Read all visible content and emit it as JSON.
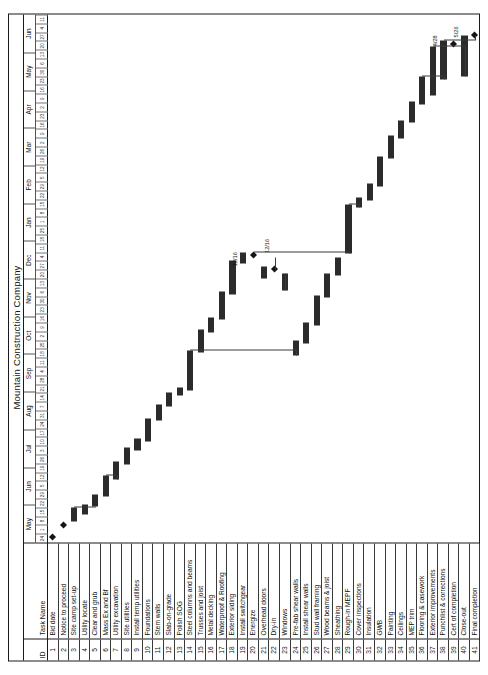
{
  "document": {
    "title": "Mountain Construction Company",
    "orientation": "landscape-rotated"
  },
  "columns": {
    "id_header": "ID",
    "name_header": "Task Name"
  },
  "timeline": {
    "months": [
      "May",
      "Jun",
      "Jul",
      "Aug",
      "Sep",
      "Oct",
      "Nov",
      "Dec",
      "Jan",
      "Feb",
      "Mar",
      "Apr",
      "May",
      "Jun"
    ],
    "week_tick_sample": [
      "24",
      "1",
      "8",
      "15",
      "22",
      "29",
      "5",
      "12",
      "19",
      "26",
      "3",
      "10",
      "17",
      "24",
      "31",
      "7",
      "14",
      "21",
      "28",
      "4",
      "11",
      "18",
      "25",
      "2",
      "9",
      "16",
      "23",
      "30",
      "6",
      "13",
      "20",
      "27",
      "4",
      "11",
      "18",
      "25",
      "1",
      "8",
      "15",
      "22",
      "29",
      "5",
      "12",
      "19",
      "26",
      "2",
      "9",
      "16",
      "23",
      "2",
      "9",
      "16",
      "23",
      "30",
      "6",
      "13",
      "20",
      "27",
      "4",
      "11"
    ]
  },
  "milestones": [
    {
      "label": "5/8"
    },
    {
      "label": "12/16"
    },
    {
      "label": "12/16"
    },
    {
      "label": "4/28"
    },
    {
      "label": "5/26"
    }
  ],
  "chart_data": {
    "type": "bar",
    "title": "Mountain Construction Company",
    "xlabel": "",
    "ylabel": "",
    "categories": [
      "Bid date",
      "Notice to proceed",
      "Site camp set-up",
      "Utility locate",
      "Clear and grub",
      "Mass Ex and Bf",
      "Utility excavation",
      "Site utilities",
      "Install temp utilities",
      "Foundations",
      "Stem walls",
      "Slab-on-grade",
      "Polish SOG",
      "Steel columns and beams",
      "Trusses and joist",
      "Metal decking",
      "Waterproof & Roofing",
      "Exterior siding",
      "Install switchgear",
      "Energize",
      "Overhead doors",
      "Dry-in",
      "Windows",
      "Pre-fab shear walls",
      "Install shear walls",
      "Stud wall framing",
      "Wood beams & joist",
      "Sheathing",
      "Rough-in MEPF",
      "Cover inspections",
      "Insulation",
      "GWB",
      "Painting",
      "Ceilings",
      "MEP trim",
      "Flooring & casework",
      "Exterior improvements",
      "Punchlist & corrections",
      "Cert of completion",
      "Close-out",
      "Final completion"
    ],
    "values": [
      0,
      4,
      5,
      3,
      6,
      10,
      9,
      8,
      4,
      12,
      7,
      6,
      3,
      14,
      10,
      6,
      12,
      14,
      4,
      2,
      5,
      8,
      7,
      6,
      9,
      13,
      11,
      8,
      22,
      4,
      7,
      13,
      10,
      8,
      9,
      12,
      10,
      8,
      2,
      5,
      0
    ]
  },
  "tasks": [
    {
      "id": "1",
      "name": "Bid date",
      "start": 0.6,
      "len": 0,
      "type": "milestone",
      "row": 0
    },
    {
      "id": "2",
      "name": "Notice to proceed",
      "start": 1.9,
      "len": 0,
      "type": "milestone",
      "row": 1
    },
    {
      "id": "3",
      "name": "Site camp set-up",
      "start": 2.4,
      "len": 1.6,
      "type": "bar",
      "row": 2
    },
    {
      "id": "4",
      "name": "Utility locate",
      "start": 3.2,
      "len": 1.1,
      "type": "bar",
      "row": 3
    },
    {
      "id": "5",
      "name": "Clear and grub",
      "start": 4.1,
      "len": 1.4,
      "type": "bar",
      "row": 4
    },
    {
      "id": "6",
      "name": "Mass Ex and Bf",
      "start": 5.2,
      "len": 2.4,
      "type": "bar",
      "row": 5
    },
    {
      "id": "7",
      "name": "Utility excavation",
      "start": 7.2,
      "len": 2.0,
      "type": "bar",
      "row": 6
    },
    {
      "id": "8",
      "name": "Site utilities",
      "start": 8.9,
      "len": 1.9,
      "type": "bar",
      "row": 7
    },
    {
      "id": "9",
      "name": "Install temp utilities",
      "start": 10.5,
      "len": 1.3,
      "type": "bar",
      "row": 8
    },
    {
      "id": "10",
      "name": "Foundations",
      "start": 11.5,
      "len": 2.6,
      "type": "bar",
      "row": 9
    },
    {
      "id": "11",
      "name": "Stem walls",
      "start": 13.9,
      "len": 1.8,
      "type": "bar",
      "row": 10
    },
    {
      "id": "12",
      "name": "Slab-on-grade",
      "start": 15.4,
      "len": 1.6,
      "type": "bar",
      "row": 11
    },
    {
      "id": "13",
      "name": "Polish SOG",
      "start": 16.7,
      "len": 0.9,
      "type": "bar",
      "row": 12
    },
    {
      "id": "14",
      "name": "Steel columns and beams",
      "start": 17.3,
      "len": 4.5,
      "type": "bar",
      "row": 13
    },
    {
      "id": "15",
      "name": "Trusses and joist",
      "start": 21.6,
      "len": 2.6,
      "type": "bar",
      "row": 14
    },
    {
      "id": "16",
      "name": "Metal decking",
      "start": 23.9,
      "len": 1.7,
      "type": "bar",
      "row": 15
    },
    {
      "id": "17",
      "name": "Waterproof & Roofing",
      "start": 25.3,
      "len": 3.2,
      "type": "bar",
      "row": 16
    },
    {
      "id": "18",
      "name": "Exterior siding",
      "start": 28.2,
      "len": 3.8,
      "type": "bar",
      "row": 17
    },
    {
      "id": "19",
      "name": "Install switchgear",
      "start": 31.7,
      "len": 1.2,
      "type": "bar",
      "row": 18
    },
    {
      "id": "20",
      "name": "Energize",
      "start": 32.6,
      "len": 0,
      "type": "milestone",
      "row": 19
    },
    {
      "id": "21",
      "name": "Overhead doors",
      "start": 30.0,
      "len": 1.4,
      "type": "bar",
      "row": 20
    },
    {
      "id": "22",
      "name": "Dry-in",
      "start": 31.0,
      "len": 0,
      "type": "milestone",
      "row": 21
    },
    {
      "id": "23",
      "name": "Windows",
      "start": 28.6,
      "len": 2.0,
      "type": "bar",
      "row": 22
    },
    {
      "id": "24",
      "name": "Pre-fab shear walls",
      "start": 21.2,
      "len": 1.7,
      "type": "bar",
      "row": 23
    },
    {
      "id": "25",
      "name": "Install shear walls",
      "start": 22.6,
      "len": 2.4,
      "type": "bar",
      "row": 24
    },
    {
      "id": "26",
      "name": "Stud wall framing",
      "start": 24.7,
      "len": 3.4,
      "type": "bar",
      "row": 25
    },
    {
      "id": "27",
      "name": "Wood beams & joist",
      "start": 27.8,
      "len": 2.8,
      "type": "bar",
      "row": 26
    },
    {
      "id": "28",
      "name": "Sheathing",
      "start": 30.3,
      "len": 2.1,
      "type": "bar",
      "row": 27
    },
    {
      "id": "29",
      "name": "Rough-in MEPF",
      "start": 32.8,
      "len": 5.6,
      "type": "bar",
      "row": 28
    },
    {
      "id": "30",
      "name": "Cover inspections",
      "start": 38.1,
      "len": 1.1,
      "type": "bar",
      "row": 29
    },
    {
      "id": "31",
      "name": "Insulation",
      "start": 38.9,
      "len": 1.9,
      "type": "bar",
      "row": 30
    },
    {
      "id": "32",
      "name": "GWB",
      "start": 40.5,
      "len": 3.4,
      "type": "bar",
      "row": 31
    },
    {
      "id": "33",
      "name": "Painting",
      "start": 43.6,
      "len": 2.6,
      "type": "bar",
      "row": 32
    },
    {
      "id": "34",
      "name": "Ceilings",
      "start": 45.9,
      "len": 2.1,
      "type": "bar",
      "row": 33
    },
    {
      "id": "35",
      "name": "MEP trim",
      "start": 47.7,
      "len": 2.4,
      "type": "bar",
      "row": 34
    },
    {
      "id": "36",
      "name": "Flooring & casework",
      "start": 49.8,
      "len": 3.1,
      "type": "bar",
      "row": 35
    },
    {
      "id": "37",
      "name": "Exterior improvements",
      "start": 50.8,
      "len": 5.6,
      "type": "bar",
      "row": 36
    },
    {
      "id": "38",
      "name": "Punchlist & corrections",
      "start": 52.6,
      "len": 4.4,
      "type": "bar",
      "row": 37
    },
    {
      "id": "39",
      "name": "Cert of completion",
      "start": 56.6,
      "len": 0,
      "type": "milestone",
      "row": 38
    },
    {
      "id": "40",
      "name": "Close-out",
      "start": 53.0,
      "len": 4.6,
      "type": "bar",
      "row": 39
    },
    {
      "id": "41",
      "name": "Final completion",
      "start": 57.6,
      "len": 0,
      "type": "milestone",
      "row": 40
    }
  ]
}
